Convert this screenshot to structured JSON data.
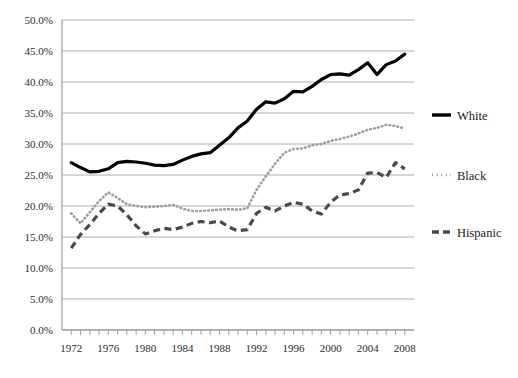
{
  "chart_data": {
    "type": "line",
    "title": "",
    "xlabel": "",
    "ylabel": "",
    "xlim": [
      1971,
      2009
    ],
    "ylim": [
      0,
      0.5
    ],
    "grid": true,
    "legend_position": "right",
    "y_ticks": [
      "0.0%",
      "5.0%",
      "10.0%",
      "15.0%",
      "20.0%",
      "25.0%",
      "30.0%",
      "35.0%",
      "40.0%",
      "45.0%",
      "50.0%"
    ],
    "x_ticks": [
      "1972",
      "1976",
      "1980",
      "1984",
      "1988",
      "1992",
      "1996",
      "2000",
      "2004",
      "2008"
    ],
    "x": [
      1972,
      1973,
      1974,
      1975,
      1976,
      1977,
      1978,
      1979,
      1980,
      1981,
      1982,
      1983,
      1984,
      1985,
      1986,
      1987,
      1988,
      1989,
      1990,
      1991,
      1992,
      1993,
      1994,
      1995,
      1996,
      1997,
      1998,
      1999,
      2000,
      2001,
      2002,
      2003,
      2004,
      2005,
      2006,
      2007,
      2008
    ],
    "series": [
      {
        "name": "White",
        "line_style": "solid",
        "color": "#000000",
        "values": [
          27.0,
          26.2,
          25.5,
          25.6,
          26.0,
          27.0,
          27.2,
          27.1,
          26.9,
          26.6,
          26.5,
          26.7,
          27.4,
          28.0,
          28.4,
          28.6,
          29.8,
          31.0,
          32.6,
          33.7,
          35.6,
          36.8,
          36.6,
          37.3,
          38.5,
          38.4,
          39.3,
          40.4,
          41.2,
          41.3,
          41.1,
          42.0,
          43.1,
          41.2,
          42.8,
          43.4,
          44.5
        ]
      },
      {
        "name": "Black",
        "line_style": "dotted",
        "color": "#9c9c9c",
        "values": [
          18.8,
          17.2,
          19.0,
          20.8,
          22.2,
          21.3,
          20.3,
          20.0,
          19.8,
          19.9,
          20.0,
          20.2,
          19.6,
          19.2,
          19.2,
          19.3,
          19.4,
          19.5,
          19.4,
          19.6,
          22.6,
          24.8,
          26.8,
          28.6,
          29.2,
          29.3,
          29.8,
          30.0,
          30.5,
          30.8,
          31.2,
          31.7,
          32.3,
          32.6,
          33.1,
          32.9,
          32.5
        ]
      },
      {
        "name": "Hispanic",
        "line_style": "dashed",
        "color": "#4a4a4a",
        "values": [
          13.2,
          15.4,
          17.0,
          18.8,
          20.3,
          20.0,
          18.6,
          16.8,
          15.5,
          16.0,
          16.4,
          16.2,
          16.6,
          17.2,
          17.5,
          17.3,
          17.6,
          16.6,
          16.0,
          16.2,
          18.8,
          19.8,
          19.2,
          20.0,
          20.6,
          20.3,
          19.2,
          18.7,
          20.6,
          21.8,
          22.0,
          22.6,
          25.3,
          25.4,
          24.6,
          27.0,
          26.0
        ]
      }
    ]
  },
  "legend": {
    "items": [
      {
        "label": "White",
        "marker": "solid-line-marker"
      },
      {
        "label": "Black",
        "marker": "dotted-line-marker"
      },
      {
        "label": "Hispanic",
        "marker": "dashed-line-marker"
      }
    ]
  },
  "caption": {
    "text": ""
  }
}
